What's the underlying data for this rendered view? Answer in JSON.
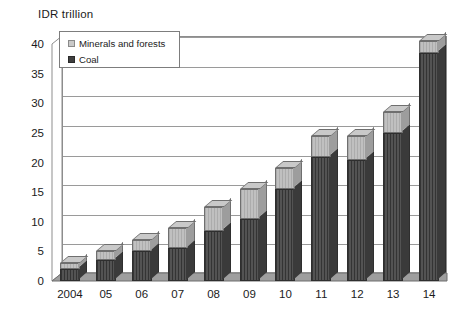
{
  "chart_data": {
    "type": "bar",
    "subtype": "stacked-column-3d",
    "title": "",
    "ylabel": "IDR trillion",
    "xlabel": "",
    "ylim": [
      0,
      40
    ],
    "ytick_step": 5,
    "grid": true,
    "legend_position": "top-left",
    "categories": [
      "2004",
      "05",
      "06",
      "07",
      "08",
      "09",
      "10",
      "11",
      "12",
      "13",
      "14"
    ],
    "yticks": [
      "0",
      "5",
      "10",
      "15",
      "20",
      "25",
      "30",
      "35",
      "40"
    ],
    "series": [
      {
        "name": "Coal",
        "color": "#4a4a4a",
        "values": [
          2.0,
          3.5,
          5.0,
          5.5,
          8.5,
          10.5,
          15.5,
          21.0,
          20.5,
          25.0,
          38.5
        ]
      },
      {
        "name": "Minerals and forests",
        "color": "#b9b9b9",
        "values": [
          1.0,
          1.5,
          2.0,
          3.5,
          4.0,
          5.0,
          3.5,
          3.5,
          4.0,
          3.5,
          2.0
        ]
      }
    ],
    "totals": [
      3.0,
      5.0,
      7.0,
      9.0,
      12.5,
      15.5,
      19.0,
      24.5,
      24.5,
      28.5,
      40.5
    ]
  },
  "legend": {
    "items": [
      {
        "label": "Minerals and forests",
        "swatch": "light-gray-square"
      },
      {
        "label": "Coal",
        "swatch": "dark-gray-square"
      }
    ]
  },
  "colors": {
    "coal": "#4a4a4a",
    "minerals": "#b9b9b9",
    "gridline": "#9a9a9a",
    "axis": "#8d8d8d",
    "text": "#1b1b1b",
    "floor": "#9e9e9e"
  }
}
